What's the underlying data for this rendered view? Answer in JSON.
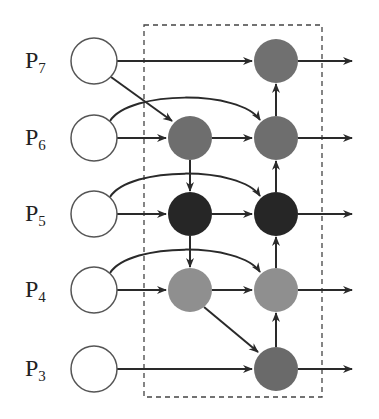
{
  "diagram": {
    "type": "feature-pyramid-dataflow",
    "rows": [
      {
        "id": "P7",
        "label": "P",
        "sub": "7",
        "y": 61
      },
      {
        "id": "P6",
        "label": "P",
        "sub": "6",
        "y": 138
      },
      {
        "id": "P5",
        "label": "P",
        "sub": "5",
        "y": 214
      },
      {
        "id": "P4",
        "label": "P",
        "sub": "4",
        "y": 290
      },
      {
        "id": "P3",
        "label": "P",
        "sub": "3",
        "y": 369
      }
    ],
    "columns": {
      "input_x": 94,
      "mid_x": 190,
      "out_x": 276,
      "arrow_end_x": 352
    },
    "nodes": [
      {
        "id": "in7",
        "row": "P7",
        "col": "input",
        "fill": "#ffffff"
      },
      {
        "id": "in6",
        "row": "P6",
        "col": "input",
        "fill": "#ffffff"
      },
      {
        "id": "in5",
        "row": "P5",
        "col": "input",
        "fill": "#ffffff"
      },
      {
        "id": "in4",
        "row": "P4",
        "col": "input",
        "fill": "#ffffff"
      },
      {
        "id": "in3",
        "row": "P3",
        "col": "input",
        "fill": "#ffffff"
      },
      {
        "id": "mid6",
        "row": "P6",
        "col": "mid",
        "fill": "#6e6e6e"
      },
      {
        "id": "mid5",
        "row": "P5",
        "col": "mid",
        "fill": "#262626"
      },
      {
        "id": "mid4",
        "row": "P4",
        "col": "mid",
        "fill": "#8f8f8f"
      },
      {
        "id": "out7",
        "row": "P7",
        "col": "out",
        "fill": "#707070"
      },
      {
        "id": "out6",
        "row": "P6",
        "col": "out",
        "fill": "#6e6e6e"
      },
      {
        "id": "out5",
        "row": "P5",
        "col": "out",
        "fill": "#262626"
      },
      {
        "id": "out4",
        "row": "P4",
        "col": "out",
        "fill": "#8f8f8f"
      },
      {
        "id": "out3",
        "row": "P3",
        "col": "out",
        "fill": "#6a6a6a"
      }
    ],
    "dashed_box": {
      "x": 144,
      "y": 25,
      "width": 178,
      "height": 372
    },
    "colors": {
      "stroke": "#2a2a2a",
      "dash": "#444444"
    }
  }
}
